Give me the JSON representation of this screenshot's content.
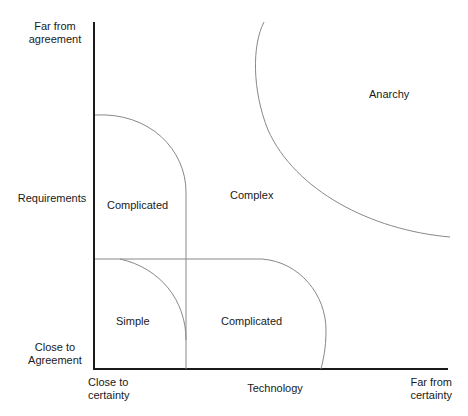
{
  "diagram": {
    "axes": {
      "y_axis": {
        "label": "Requirements",
        "top_label": "Far from\nagreement",
        "bottom_label": "Close to\nAgreement"
      },
      "x_axis": {
        "label": "Technology",
        "left_label": "Close to\ncertainty",
        "right_label": "Far from\ncertainty"
      }
    },
    "regions": [
      {
        "id": "simple",
        "label": "Simple"
      },
      {
        "id": "complicated-requirements",
        "label": "Complicated"
      },
      {
        "id": "complicated-technology",
        "label": "Complicated"
      },
      {
        "id": "complex",
        "label": "Complex"
      },
      {
        "id": "anarchy",
        "label": "Anarchy"
      }
    ],
    "colors": {
      "axis": "#1a1a1a",
      "boundary": "#777777",
      "text": "#1a1a1a"
    }
  }
}
